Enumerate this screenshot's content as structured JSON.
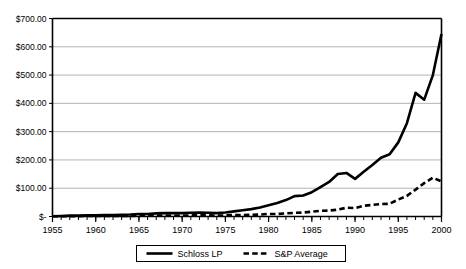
{
  "chart_data": {
    "type": "line",
    "title": "",
    "subtitle": "",
    "xlabel": "",
    "ylabel": "",
    "xlim": [
      1955,
      2000
    ],
    "ylim": [
      0,
      700
    ],
    "grid": true,
    "grid_axis": "y",
    "legend_position": "bottom",
    "y_ticks": [
      0,
      100,
      200,
      300,
      400,
      500,
      600,
      700
    ],
    "y_tick_labels": [
      "$-",
      "$100.00",
      "$200.00",
      "$300.00",
      "$400.00",
      "$500.00",
      "$600.00",
      "$700.00"
    ],
    "x_ticks": [
      1955,
      1960,
      1965,
      1970,
      1975,
      1980,
      1985,
      1990,
      1995,
      2000
    ],
    "x_tick_labels": [
      "1955",
      "1960",
      "1965",
      "1970",
      "1975",
      "1980",
      "1985",
      "1990",
      "1995",
      "2000"
    ],
    "x_minor_tick_interval": 1,
    "x": [
      1955,
      1956,
      1957,
      1958,
      1959,
      1960,
      1961,
      1962,
      1963,
      1964,
      1965,
      1966,
      1967,
      1968,
      1969,
      1970,
      1971,
      1972,
      1973,
      1974,
      1975,
      1976,
      1977,
      1978,
      1979,
      1980,
      1981,
      1982,
      1983,
      1984,
      1985,
      1986,
      1987,
      1988,
      1989,
      1990,
      1991,
      1992,
      1993,
      1994,
      1995,
      1996,
      1997,
      1998,
      1999,
      2000
    ],
    "series": [
      {
        "name": "Schloss LP",
        "style": "solid",
        "color": "#000000",
        "width": 2.6,
        "values": [
          1,
          2,
          3,
          3,
          4,
          4,
          5,
          5,
          6,
          7,
          9,
          9,
          11,
          12,
          12,
          12,
          13,
          14,
          13,
          12,
          14,
          18,
          22,
          26,
          32,
          40,
          48,
          58,
          72,
          74,
          86,
          104,
          122,
          150,
          154,
          133,
          158,
          182,
          208,
          220,
          262,
          330,
          437,
          413,
          500,
          645
        ]
      },
      {
        "name": "S&P Average",
        "style": "dashed",
        "color": "#000000",
        "width": 2.6,
        "values": [
          1,
          1,
          1,
          1,
          2,
          2,
          2,
          2,
          2,
          2,
          3,
          3,
          3,
          3,
          3,
          3,
          4,
          4,
          4,
          3,
          4,
          5,
          5,
          6,
          7,
          9,
          9,
          11,
          13,
          14,
          17,
          20,
          21,
          24,
          31,
          30,
          38,
          41,
          44,
          45,
          60,
          73,
          95,
          118,
          137,
          124
        ]
      }
    ],
    "legend": [
      {
        "label": "Schloss LP",
        "style": "solid"
      },
      {
        "label": "S&P Average",
        "style": "dashed"
      }
    ],
    "colors": {
      "axis": "#000000",
      "gridline": "#b3b3b3",
      "background": "#ffffff",
      "text": "#000000"
    }
  }
}
